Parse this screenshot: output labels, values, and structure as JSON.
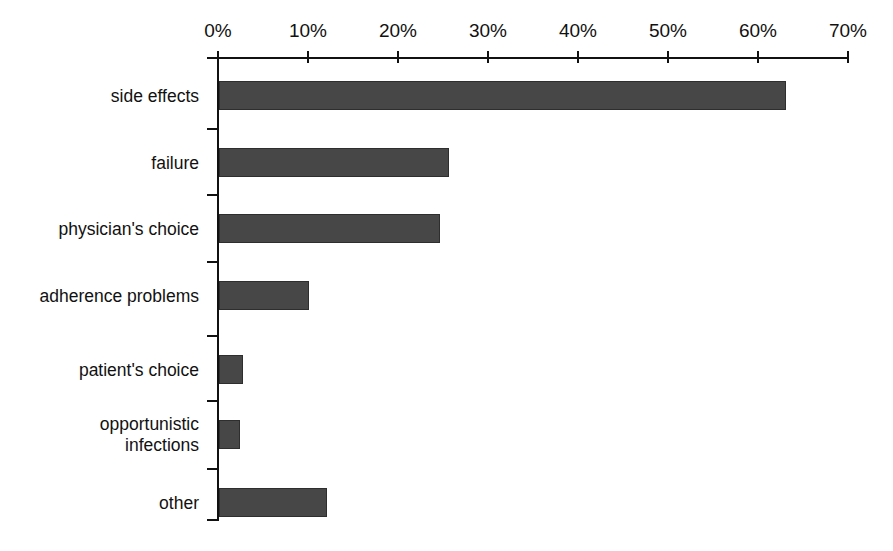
{
  "chart_data": {
    "type": "bar",
    "orientation": "horizontal",
    "title": "",
    "subtitle": "",
    "xlabel": "",
    "ylabel": "",
    "xlim": [
      0,
      70
    ],
    "xunit": "%",
    "grid": false,
    "legend": null,
    "axis_position": "top",
    "bar_color": "#474747",
    "axis_color": "#111111",
    "background": "#ffffff",
    "categories": [
      "side effects",
      "failure",
      "physician's choice",
      "adherence problems",
      "patient's choice",
      "opportunistic\ninfections",
      "other"
    ],
    "values": [
      63,
      25.5,
      24.5,
      10,
      2.7,
      2.3,
      12
    ],
    "tick_labels": [
      "0%",
      "10%",
      "20%",
      "30%",
      "40%",
      "50%",
      "60%",
      "70%"
    ],
    "tick_values": [
      0,
      10,
      20,
      30,
      40,
      50,
      60,
      70
    ]
  },
  "bars": [
    {
      "label": "side effects",
      "value": 63,
      "top": 81
    },
    {
      "label": "failure",
      "value": 25.5,
      "top": 148
    },
    {
      "label": "physician's choice",
      "value": 24.5,
      "top": 214
    },
    {
      "label": "adherence problems",
      "value": 10,
      "top": 281
    },
    {
      "label": "patient's choice",
      "value": 2.7,
      "top": 355
    },
    {
      "label": "opportunistic\ninfections",
      "value": 2.3,
      "top": 420
    },
    {
      "label": "other",
      "value": 12,
      "top": 488
    }
  ]
}
